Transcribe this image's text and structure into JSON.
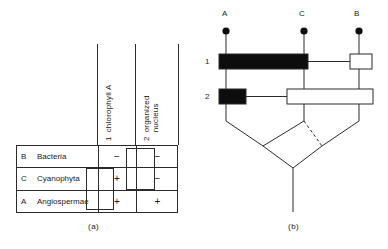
{
  "panel_a": {
    "caption": "(a)",
    "columns": [
      {
        "num": "1",
        "label": "chlorophyll A"
      },
      {
        "num": "2",
        "label_line1": "organized",
        "label_line2": "nucleus"
      }
    ],
    "rows": [
      {
        "code": "B",
        "taxon": "Bacteria",
        "c1": "−",
        "c2": "−"
      },
      {
        "code": "C",
        "taxon": "Cyanophyta",
        "c1": "+",
        "c2": "−"
      },
      {
        "code": "A",
        "taxon": "Angiospermae",
        "c1": "+",
        "c2": "+"
      }
    ],
    "grouping_boxes": [
      {
        "column": "1",
        "states": "+ shared by Cyanophyta and Angiospermae"
      },
      {
        "column": "2",
        "states": "− shared by Bacteria and Cyanophyta"
      }
    ]
  },
  "panel_b": {
    "caption": "(b)",
    "otus": [
      {
        "label": "A"
      },
      {
        "label": "C"
      },
      {
        "label": "B"
      }
    ],
    "character_rows": [
      {
        "num": "1",
        "name": "chlorophyll A"
      },
      {
        "num": "2",
        "name": "organized nucleus"
      }
    ],
    "bars": [
      {
        "row": "1",
        "fill": "black",
        "spans": "A to C"
      },
      {
        "row": "1",
        "fill": "white",
        "spans": "B"
      },
      {
        "row": "2",
        "fill": "black",
        "spans": "A"
      },
      {
        "row": "2",
        "fill": "white",
        "spans": "C to B"
      }
    ],
    "colors": {
      "stroke": "#2b2b2b",
      "fill_black": "#0d0d0d",
      "fill_white": "#ffffff"
    }
  }
}
